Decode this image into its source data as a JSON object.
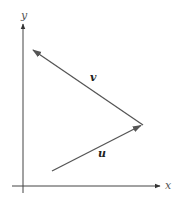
{
  "diagram": {
    "type": "vector-diagram",
    "axes": {
      "x_label": "x",
      "y_label": "y",
      "origin": [
        23,
        186
      ]
    },
    "vectors": [
      {
        "name": "u",
        "label": "u",
        "from": [
          52,
          171
        ],
        "to": [
          142,
          125
        ]
      },
      {
        "name": "v",
        "label": "v",
        "from": [
          142,
          125
        ],
        "to": [
          33,
          50
        ]
      }
    ],
    "colors": {
      "axis": "#444444",
      "vector": "#555555",
      "label": "#222222"
    }
  }
}
